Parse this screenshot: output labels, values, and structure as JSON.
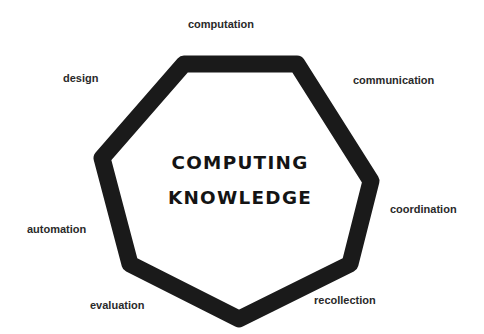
{
  "diagram": {
    "title_line1": "COMPUTING",
    "title_line2": "KNOWLEDGE",
    "shape": "heptagon",
    "stroke_color": "#1a1a1a",
    "background_color": "#ffffff",
    "vertices": [
      {
        "x": 184,
        "y": 64
      },
      {
        "x": 297,
        "y": 64
      },
      {
        "x": 371,
        "y": 181
      },
      {
        "x": 350,
        "y": 264
      },
      {
        "x": 239,
        "y": 319
      },
      {
        "x": 130,
        "y": 264
      },
      {
        "x": 102,
        "y": 158
      }
    ],
    "labels": [
      {
        "id": "computation",
        "text": "computation"
      },
      {
        "id": "communication",
        "text": "communication"
      },
      {
        "id": "coordination",
        "text": "coordination"
      },
      {
        "id": "recollection",
        "text": "recollection"
      },
      {
        "id": "evaluation",
        "text": "evaluation"
      },
      {
        "id": "automation",
        "text": "automation"
      },
      {
        "id": "design",
        "text": "design"
      }
    ]
  }
}
